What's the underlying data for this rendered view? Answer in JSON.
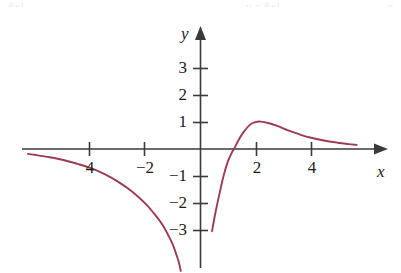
{
  "figure": {
    "name": "rational-function-graph",
    "background_color": "#ffffff",
    "axis_color": "#3a3a3a",
    "curve_color": "#9d3b51",
    "text_color": "#1b1b1b"
  },
  "axes": {
    "x_label": "x",
    "y_label": "y"
  },
  "top_artifacts": [
    {
      "text": "f(x)",
      "left": 8,
      "top": 0
    },
    {
      "text": "y = f(x)",
      "left": 246,
      "top": 0
    },
    {
      "text": "x",
      "left": 388,
      "top": 0
    }
  ],
  "chart_data": {
    "type": "line",
    "title": "",
    "subtitle": "",
    "xlabel": "x",
    "ylabel": "y",
    "xlim": [
      -6.3,
      6.5
    ],
    "ylim": [
      -4.5,
      4.4
    ],
    "grid": false,
    "legend": null,
    "x_ticks": [
      -4,
      -2,
      2,
      4
    ],
    "x_tick_labels": [
      "4",
      "2",
      "2",
      "4"
    ],
    "x_tick_labels_rendered": [
      "4",
      "−2",
      "2",
      "4"
    ],
    "y_ticks": [
      3,
      2,
      1,
      -1,
      -2,
      -3
    ],
    "y_tick_labels": [
      "3",
      "2",
      "1",
      "−1",
      "−2",
      "−3"
    ],
    "annotations": [
      "vertical asymptote near x = 1",
      "horizontal asymptote y = 0 as x → +∞",
      "local maximum of about y = 1 near x = 2"
    ],
    "series": [
      {
        "name": "left-branch",
        "description": "decreasing branch left of the vertical asymptote, entering from the left just below y = 0 and falling steeply off the bottom of the frame",
        "points": [
          [
            -6.3,
            -0.18
          ],
          [
            -6.0,
            -0.22
          ],
          [
            -5.5,
            -0.3
          ],
          [
            -5.0,
            -0.4
          ],
          [
            -4.5,
            -0.54
          ],
          [
            -4.0,
            -0.7
          ],
          [
            -3.5,
            -0.92
          ],
          [
            -3.0,
            -1.2
          ],
          [
            -2.5,
            -1.55
          ],
          [
            -2.0,
            -2.0
          ],
          [
            -1.7,
            -2.35
          ],
          [
            -1.4,
            -2.75
          ],
          [
            -1.15,
            -3.2
          ],
          [
            -1.0,
            -3.52
          ],
          [
            -0.9,
            -3.8
          ],
          [
            -0.8,
            -4.1
          ],
          [
            -0.72,
            -4.45
          ]
        ]
      },
      {
        "name": "right-branch",
        "description": "branch right of the vertical asymptote rising from about y = -3 steeply, crossing the x-axis near x = 1.25, peaking near y = 1 at x = 2, then decaying toward y = 0",
        "points": [
          [
            0.42,
            -3.0
          ],
          [
            0.55,
            -2.3
          ],
          [
            0.7,
            -1.6
          ],
          [
            0.85,
            -0.95
          ],
          [
            1.0,
            -0.45
          ],
          [
            1.15,
            -0.12
          ],
          [
            1.25,
            0.05
          ],
          [
            1.4,
            0.35
          ],
          [
            1.6,
            0.65
          ],
          [
            1.8,
            0.88
          ],
          [
            2.0,
            0.98
          ],
          [
            2.2,
            1.0
          ],
          [
            2.5,
            0.94
          ],
          [
            2.8,
            0.84
          ],
          [
            3.2,
            0.68
          ],
          [
            3.6,
            0.54
          ],
          [
            4.0,
            0.42
          ],
          [
            4.5,
            0.31
          ],
          [
            5.0,
            0.23
          ],
          [
            5.4,
            0.18
          ],
          [
            5.7,
            0.15
          ]
        ]
      }
    ]
  }
}
